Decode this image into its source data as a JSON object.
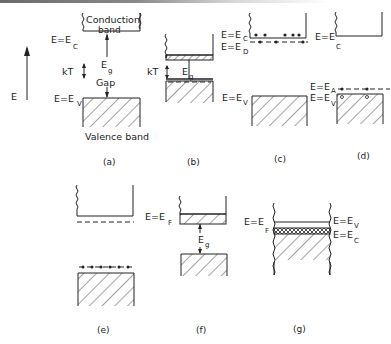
{
  "axis": {
    "label": "E"
  },
  "panels": {
    "a": {
      "caption": "(a)",
      "conduction_label_line1": "Conduction",
      "conduction_label_line2": "band",
      "valence_label": "Valence band",
      "ec_label": "E=E",
      "ec_sub": "C",
      "ev_label": "E=E",
      "ev_sub": "V",
      "kt_label": "kT",
      "eg_label": "E",
      "eg_sub": "g",
      "gap_label": "Gap"
    },
    "b": {
      "caption": "(b)",
      "kt_label": "kT",
      "eg_label": "E",
      "eg_sub": "g"
    },
    "c": {
      "caption": "(c)",
      "ec_label": "E=E",
      "ec_sub": "C",
      "ed_label": "E=E",
      "ed_sub": "D",
      "ev_label": "E=E",
      "ev_sub": "V"
    },
    "d": {
      "caption": "(d)",
      "ec_label": "E=E",
      "ec_sub": "C",
      "ea_label": "E=E",
      "ea_sub": "A",
      "ev_label": "E=E",
      "ev_sub": "V"
    },
    "e": {
      "caption": "(e)"
    },
    "f": {
      "caption": "(f)",
      "ef_label": "E=E",
      "ef_sub": "F",
      "eg_label": "E",
      "eg_sub": "g"
    },
    "g": {
      "caption": "(g)",
      "ef_label": "E=E",
      "ef_sub": "F",
      "ev_label": "E=E",
      "ev_sub": "V",
      "ec_label": "E=E",
      "ec_sub": "C"
    }
  }
}
